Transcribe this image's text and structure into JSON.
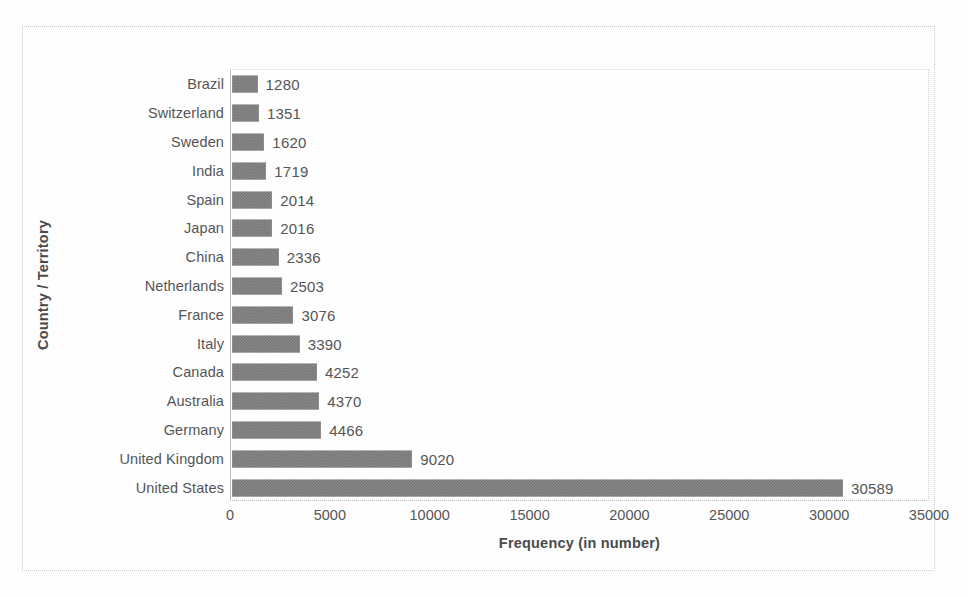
{
  "chart_data": {
    "type": "bar",
    "orientation": "horizontal",
    "title": "",
    "xlabel": "Frequency (in number)",
    "ylabel": "Country / Territory",
    "xlim": [
      0,
      35000
    ],
    "xticks": [
      0,
      5000,
      10000,
      15000,
      20000,
      25000,
      30000,
      35000
    ],
    "xtick_labels": [
      "0",
      "5000",
      "10000",
      "15000",
      "20000",
      "25000",
      "30000",
      "35000"
    ],
    "grid": false,
    "legend": null,
    "data_labels_shown": true,
    "bar_color": "#8b8b8b",
    "categories": [
      "Brazil",
      "Switzerland",
      "Sweden",
      "India",
      "Spain",
      "Japan",
      "China",
      "Netherlands",
      "France",
      "Italy",
      "Canada",
      "Australia",
      "Germany",
      "United Kingdom",
      "United States"
    ],
    "values": [
      1280,
      1351,
      1620,
      1719,
      2014,
      2016,
      2336,
      2503,
      3076,
      3390,
      4252,
      4370,
      4466,
      9020,
      30589
    ],
    "value_labels": [
      "1280",
      "1351",
      "1620",
      "1719",
      "2014",
      "2016",
      "2336",
      "2503",
      "3076",
      "3390",
      "4252",
      "4370",
      "4466",
      "9020",
      "30589"
    ]
  }
}
